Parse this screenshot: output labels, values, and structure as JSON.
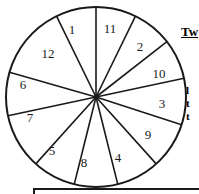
{
  "figure": {
    "type": "pie-sector-diagram",
    "shape": "circle",
    "center": {
      "x": 96,
      "y": 97
    },
    "radius": 90,
    "sector_count": 12,
    "stroke_color": "#1a1a1a",
    "fill_color": "#ffffff",
    "sectors": [
      {
        "label": "1",
        "start_deg": 244,
        "end_deg": 270,
        "label_x": 72,
        "label_y": 31
      },
      {
        "label": "11",
        "start_deg": 270,
        "end_deg": 296,
        "label_x": 110,
        "label_y": 30
      },
      {
        "label": "2",
        "start_deg": 296,
        "end_deg": 322,
        "label_x": 140,
        "label_y": 48
      },
      {
        "label": "10",
        "start_deg": 322,
        "end_deg": 348,
        "label_x": 159,
        "label_y": 75
      },
      {
        "label": "3",
        "start_deg": 348,
        "end_deg": 18,
        "label_x": 162,
        "label_y": 105
      },
      {
        "label": "9",
        "start_deg": 18,
        "end_deg": 48,
        "label_x": 148,
        "label_y": 136
      },
      {
        "label": "4",
        "start_deg": 48,
        "end_deg": 76,
        "label_x": 118,
        "label_y": 159
      },
      {
        "label": "8",
        "start_deg": 76,
        "end_deg": 104,
        "label_x": 84,
        "label_y": 164
      },
      {
        "label": "5",
        "start_deg": 104,
        "end_deg": 132,
        "label_x": 52,
        "label_y": 152
      },
      {
        "label": "7",
        "start_deg": 132,
        "end_deg": 168,
        "label_x": 30,
        "label_y": 119
      },
      {
        "label": "6",
        "start_deg": 168,
        "end_deg": 196,
        "label_x": 23,
        "label_y": 86
      },
      {
        "label": "12",
        "start_deg": 196,
        "end_deg": 244,
        "label_x": 48,
        "label_y": 55
      }
    ]
  },
  "side_panel": {
    "heading": "Tw",
    "lines": [
      "l",
      "t",
      "t"
    ]
  },
  "bottom_box": {
    "visible": true
  }
}
